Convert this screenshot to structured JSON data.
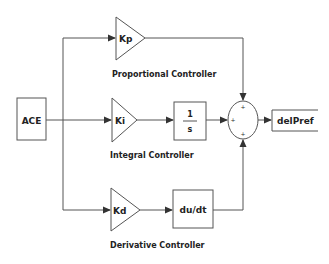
{
  "diagram": {
    "type": "block-diagram",
    "input": {
      "label": "ACE"
    },
    "output": {
      "label": "delPref"
    },
    "blocks": {
      "kp": {
        "label": "Kp",
        "shape": "gain-triangle"
      },
      "ki": {
        "label": "Ki",
        "shape": "gain-triangle"
      },
      "kd": {
        "label": "Kd",
        "shape": "gain-triangle"
      },
      "integrator": {
        "numerator": "1",
        "denominator": "s"
      },
      "derivative": {
        "label": "du/dt"
      },
      "sum": {
        "signs": [
          "+",
          "+",
          "+"
        ]
      }
    },
    "captions": {
      "proportional": "Proportional Controller",
      "integral": "Integral Controller",
      "derivative": "Derivative Controller"
    },
    "colors": {
      "stroke": "#555555",
      "text": "#222222",
      "background": "#ffffff"
    }
  }
}
